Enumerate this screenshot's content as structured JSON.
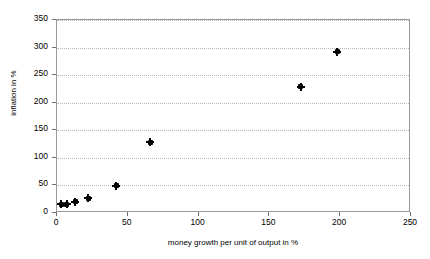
{
  "chart_data": {
    "type": "scatter",
    "title": "",
    "xlabel": "money growth per unit of output in %",
    "ylabel": "inflation in %",
    "xlim": [
      0,
      250
    ],
    "ylim": [
      0,
      350
    ],
    "xticks": [
      0,
      50,
      100,
      150,
      200,
      250
    ],
    "yticks": [
      0,
      50,
      100,
      150,
      200,
      250,
      300,
      350
    ],
    "grid": "horizontal-dotted",
    "legend": "none",
    "marker": "filled-diamond",
    "marker_color": "#000000",
    "gridline_color": "#b8b8b8",
    "axis_color": "#9a9a9a",
    "points": [
      {
        "x": 3,
        "y": 16
      },
      {
        "x": 7,
        "y": 16
      },
      {
        "x": 13,
        "y": 20
      },
      {
        "x": 22,
        "y": 27
      },
      {
        "x": 42,
        "y": 49
      },
      {
        "x": 66,
        "y": 128
      },
      {
        "x": 172,
        "y": 229
      },
      {
        "x": 198,
        "y": 292
      }
    ]
  }
}
